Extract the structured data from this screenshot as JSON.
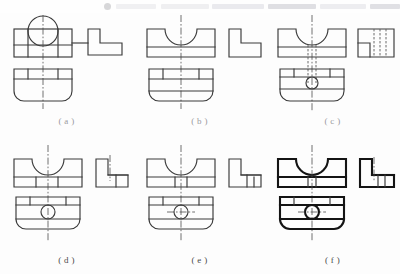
{
  "page": {
    "background_color": "#fdfdfd",
    "line_color": "#3a3a3a",
    "bold_line_color": "#141414",
    "hidden_line_color": "#5a5a5a",
    "center_line_color": "#4d4d4d"
  },
  "toolbar": {
    "visible": true,
    "appearance": "faded partially-visible browser toolbar strip",
    "dot_icon": "circle-icon",
    "segments": [
      {
        "name": "segment-1",
        "color": "#e6e6ea"
      },
      {
        "name": "segment-2",
        "color": "#e4e4e8"
      },
      {
        "name": "segment-3",
        "color": "#dcdce2"
      },
      {
        "name": "segment-4",
        "color": "#c7c7cf"
      },
      {
        "name": "segment-5",
        "color": "#e0e0e6"
      },
      {
        "name": "segment-6",
        "color": "#c9c9d1"
      }
    ]
  },
  "figures": [
    {
      "id": "a",
      "label": "( a )",
      "label_faint": true,
      "description": "Front view rectangle with overlapping circle at top, horizontal band, bottom view with rounded bottom corners, L-shaped side view",
      "features": [
        "circle-outline",
        "vertical-centerline",
        "rounded-bottom-corners",
        "l-shaped-side-view"
      ]
    },
    {
      "id": "b",
      "label": "( b )",
      "label_faint": true,
      "description": "Front view with semicircular U-notch cut from top, bottom view with rounded bottom corners, L-shaped side view",
      "features": [
        "u-notch",
        "vertical-centerline",
        "rounded-bottom-corners",
        "l-shaped-side-view"
      ]
    },
    {
      "id": "c",
      "label": "( c )",
      "label_faint": true,
      "description": "Front view with U-notch and hidden lines, bottom view with circular hole, side view with vertical hidden lines",
      "features": [
        "u-notch",
        "hidden-lines",
        "circular-hole",
        "rounded-bottom-corners",
        "stepped-side-view"
      ]
    },
    {
      "id": "d",
      "label": "( d )",
      "label_faint": false,
      "description": "Front view with U-notch, bottom view with circular hole and centerline, stepped L-shaped side view",
      "features": [
        "u-notch",
        "circular-hole",
        "vertical-centerline",
        "rounded-bottom-corners",
        "stepped-side-view"
      ]
    },
    {
      "id": "e",
      "label": "( e )",
      "label_faint": false,
      "description": "Front view with U-notch, bottom view with circular hole and crosshair centerlines, stepped L-shaped side view",
      "features": [
        "u-notch",
        "circular-hole",
        "crosshair-centerlines",
        "rounded-bottom-corners",
        "stepped-side-view"
      ]
    },
    {
      "id": "f",
      "label": "( f )",
      "label_faint": false,
      "description": "Bold outline front view with U-notch, bottom view with circular hole and crosshair, bold L-shaped side view",
      "features": [
        "u-notch",
        "circular-hole",
        "crosshair-centerlines",
        "bold-outlines",
        "rounded-bottom-corners",
        "l-shaped-side-view"
      ]
    }
  ]
}
